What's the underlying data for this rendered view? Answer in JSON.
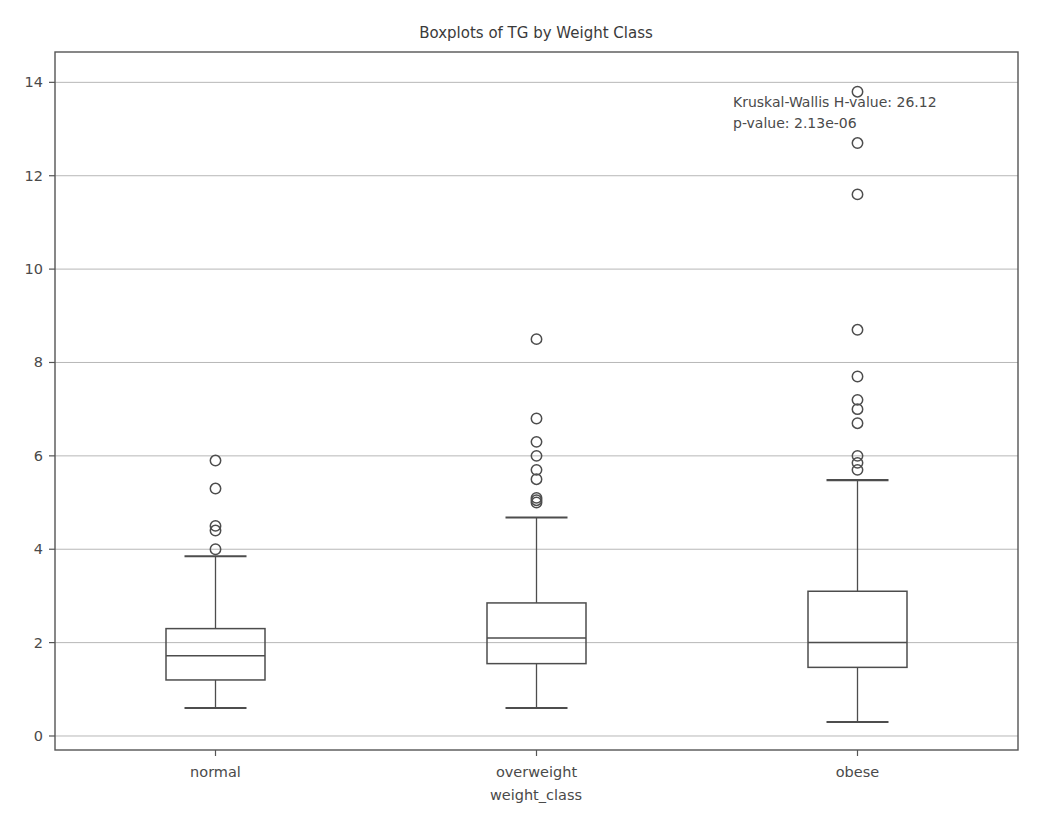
{
  "chart_data": {
    "type": "box",
    "title": "Boxplots of TG by Weight Class",
    "xlabel": "weight_class",
    "ylabel": "",
    "categories": [
      "normal",
      "overweight",
      "obese"
    ],
    "ylim": [
      -0.3,
      14.65
    ],
    "xlim": [
      0.5,
      3.5
    ],
    "yticks": [
      0,
      2,
      4,
      6,
      8,
      10,
      12,
      14
    ],
    "ytick_labels": [
      "0",
      "2",
      "4",
      "6",
      "8",
      "10",
      "12",
      "14"
    ],
    "grid": true,
    "grid_axis": "y",
    "legend": false,
    "annotations": [
      "Kruskal-Wallis H-value: 26.12",
      "p-value: 2.13e-06"
    ],
    "boxes": [
      {
        "name": "normal",
        "position": 1,
        "q1": 1.2,
        "median": 1.72,
        "q3": 2.3,
        "whisker_low": 0.6,
        "whisker_high": 3.85,
        "outliers": [
          4.0,
          4.4,
          4.5,
          5.3,
          5.9
        ]
      },
      {
        "name": "overweight",
        "position": 2,
        "q1": 1.55,
        "median": 2.1,
        "q3": 2.85,
        "whisker_low": 0.6,
        "whisker_high": 4.68,
        "outliers": [
          5.0,
          5.05,
          5.1,
          5.5,
          5.7,
          6.0,
          6.3,
          6.8,
          8.5
        ]
      },
      {
        "name": "obese",
        "position": 3,
        "q1": 1.47,
        "median": 2.0,
        "q3": 3.1,
        "whisker_low": 0.3,
        "whisker_high": 5.48,
        "outliers": [
          5.7,
          5.85,
          6.0,
          6.7,
          7.0,
          7.2,
          7.7,
          8.7,
          11.6,
          12.7,
          13.8
        ]
      }
    ],
    "colors": {
      "box_edge": "#4d4d4d",
      "median": "#4d4d4d",
      "whisker": "#4d4d4d",
      "flier_edge": "#4d4d4d",
      "grid": "#b8b8b8",
      "spine": "#555555",
      "text": "#3a3a3a",
      "background": "#ffffff"
    }
  },
  "annotation_block": {
    "line1": "Kruskal-Wallis H-value: 26.12",
    "line2": "p-value: 2.13e-06"
  }
}
